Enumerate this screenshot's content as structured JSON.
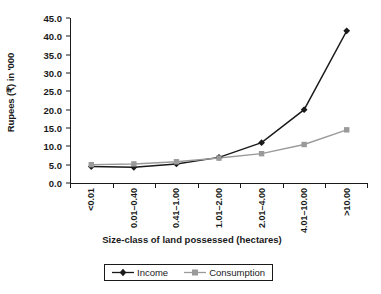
{
  "chart_data": {
    "type": "line",
    "title": "",
    "xlabel": "Size-class of land possessed (hectares)",
    "ylabel": "Rupees (₹) in '000",
    "categories": [
      "<0.01",
      "0.01–0.40",
      "0.41–1.00",
      "1.01–2.00",
      "2.01–4.00",
      "4.01–10.00",
      ">10.00"
    ],
    "series": [
      {
        "name": "Income",
        "color": "#1a1a1a",
        "marker": "diamond",
        "values": [
          4.5,
          4.3,
          5.2,
          7.0,
          11.0,
          20.0,
          41.5
        ]
      },
      {
        "name": "Consumption",
        "color": "#9a9a9a",
        "marker": "square",
        "values": [
          5.0,
          5.2,
          5.8,
          6.8,
          8.0,
          10.5,
          14.5
        ]
      }
    ],
    "ylim": [
      0.0,
      45.0
    ],
    "ytick_step": 5.0,
    "ytick_labels": [
      "45.0",
      "40.0",
      "35.0",
      "30.0",
      "25.0",
      "20.0",
      "15.0",
      "10.0",
      "5.0",
      "0.0"
    ],
    "grid": false,
    "legend_position": "bottom"
  },
  "legend": {
    "entries": [
      {
        "label": "Income"
      },
      {
        "label": "Consumption"
      }
    ]
  }
}
